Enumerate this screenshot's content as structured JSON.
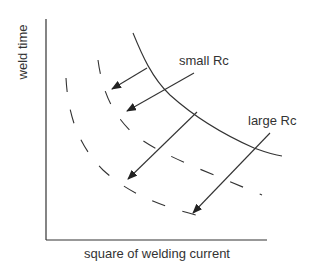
{
  "diagram": {
    "axes": {
      "y_label": "weld time",
      "x_label": "square of welding current"
    },
    "annotations": {
      "small_rc": "small Rc",
      "large_rc": "large Rc"
    },
    "curves": [
      {
        "name": "reference",
        "style": "solid"
      },
      {
        "name": "shifted-small-rc",
        "style": "dashed"
      },
      {
        "name": "shifted-large-rc",
        "style": "dashed"
      }
    ],
    "arrows_count": 4,
    "colors": {
      "line": "#333333",
      "background": "#ffffff"
    }
  }
}
